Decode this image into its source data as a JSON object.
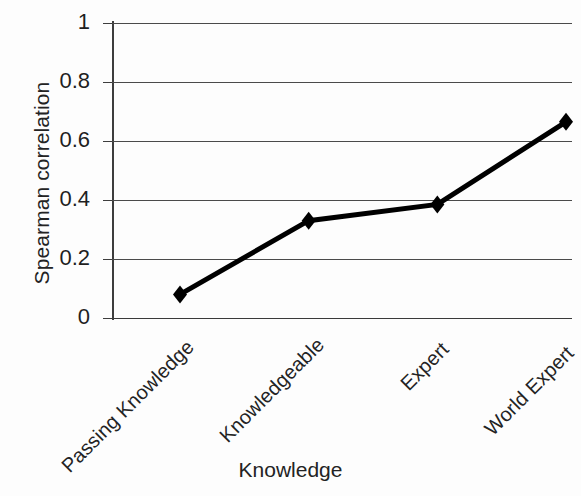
{
  "chart_data": {
    "type": "line",
    "title": "",
    "xlabel": "Knowledge",
    "ylabel": "Spearman correlation",
    "categories": [
      "Passing Knowledge",
      "Knowledgeable",
      "Expert",
      "World Expert"
    ],
    "values": [
      0.08,
      0.33,
      0.385,
      0.665
    ],
    "series": [
      {
        "name": "Spearman correlation",
        "values": [
          0.08,
          0.33,
          0.385,
          0.665
        ],
        "color": "#000000",
        "marker": "diamond",
        "line_width": 5
      }
    ],
    "ylim": [
      0,
      1
    ],
    "yticks": [
      "0",
      "0.2",
      "0.4",
      "0.6",
      "0.8",
      "1"
    ],
    "ytick_values": [
      0,
      0.2,
      0.4,
      0.6,
      0.8,
      1
    ],
    "grid": true,
    "grid_axis": "y",
    "legend": false,
    "legend_position": "none",
    "xtick_rotation": -45,
    "background_color": "#fdfdfd",
    "axis_color": "#3d3d3d",
    "grid_color": "#4a4a4a"
  }
}
